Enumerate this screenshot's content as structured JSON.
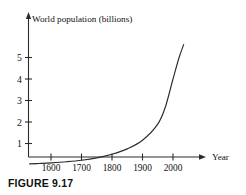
{
  "caption": "FIGURE 9.17",
  "chart_data": {
    "type": "line",
    "title": "World population (billions)",
    "xlabel": "Year",
    "ylabel": "",
    "x_tick_labels": [
      "1600",
      "1700",
      "1800",
      "1900",
      "2000"
    ],
    "x_ticks": [
      1600,
      1700,
      1800,
      1900,
      2000
    ],
    "y_tick_labels": [
      "1",
      "2",
      "3",
      "4",
      "5"
    ],
    "y_ticks": [
      1,
      2,
      3,
      4,
      5
    ],
    "xlim": [
      1530,
      2040
    ],
    "ylim": [
      0,
      5.6
    ],
    "grid": false,
    "legend": false,
    "axis_arrows": [
      "x-right",
      "y-up"
    ],
    "series": [
      {
        "name": "World population",
        "x": [
          1530,
          1560,
          1600,
          1650,
          1700,
          1750,
          1800,
          1850,
          1900,
          1950,
          1975,
          2000,
          2020,
          2035
        ],
        "values": [
          0.05,
          0.07,
          0.1,
          0.15,
          0.22,
          0.33,
          0.5,
          0.75,
          1.15,
          1.9,
          2.7,
          4.0,
          5.0,
          5.6
        ]
      }
    ]
  }
}
